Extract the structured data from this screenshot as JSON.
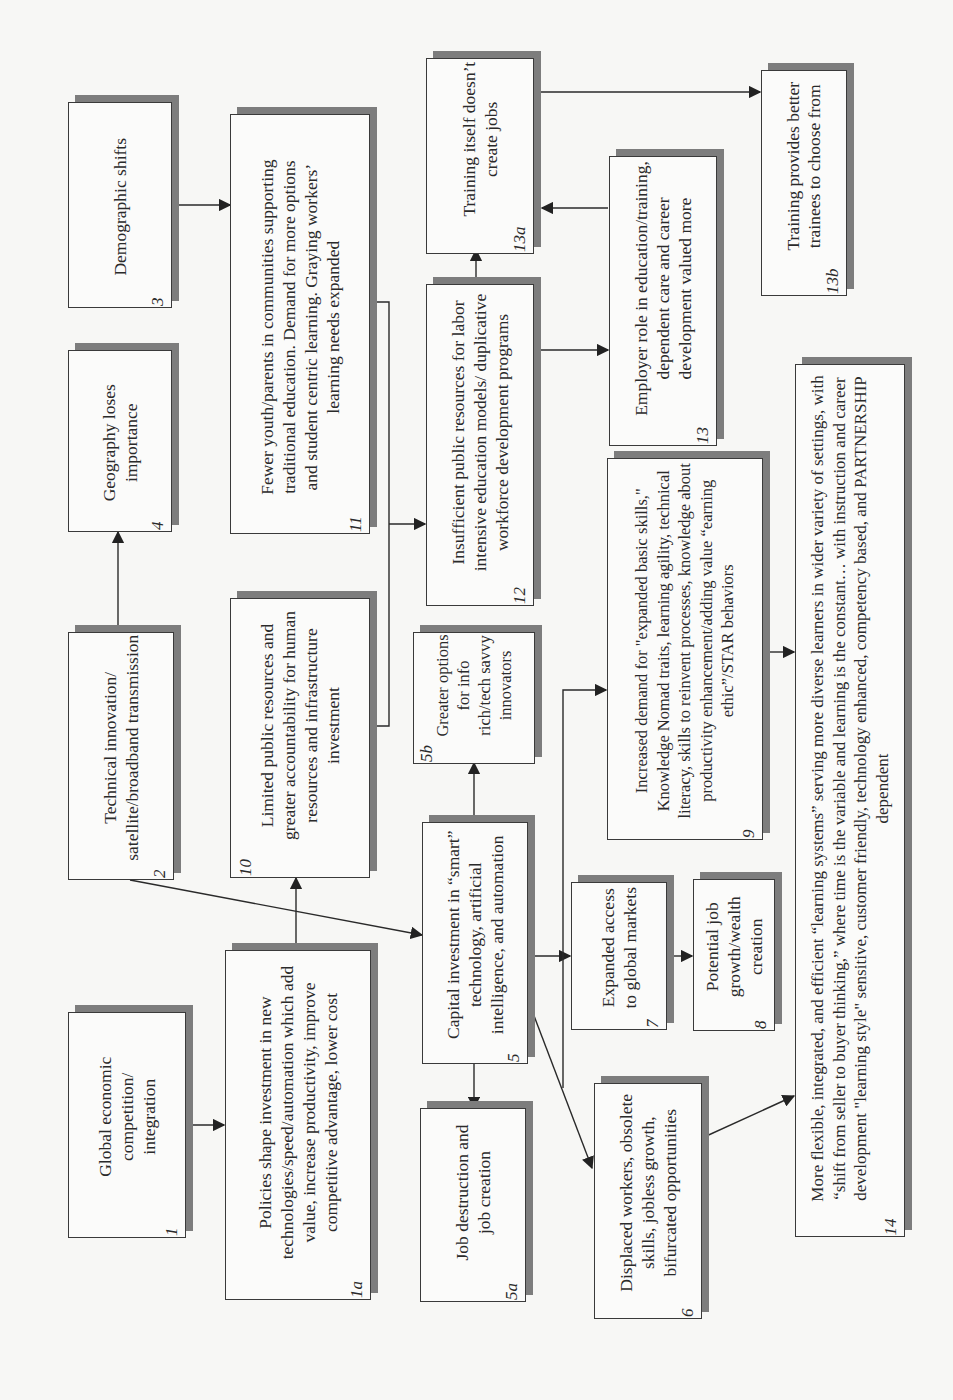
{
  "diagram": {
    "orientation": "rotated 90 degrees counter-clockwise",
    "colors": {
      "border": "#3a3a3a",
      "shadow": "#7d7d7d",
      "box_fill": "#fbfbfa",
      "background": "#f7f7f5"
    },
    "nodes": {
      "n1": {
        "id": "1",
        "text": "Global economic competition/ integration"
      },
      "n1a": {
        "id": "1a",
        "text": "Policies shape investment in new technologies/speed/automation which add value, increase productivity, improve competitive advantage, lower cost"
      },
      "n2": {
        "id": "2",
        "text": "Technical innovation/ satellite/broadband transmission"
      },
      "n3": {
        "id": "3",
        "text": "Demographic shifts"
      },
      "n4": {
        "id": "4",
        "text": "Geography loses importance"
      },
      "n5": {
        "id": "5",
        "text": "Capital investment in “smart” technology, artificial intelligence, and automation"
      },
      "n5a": {
        "id": "5a",
        "text": "Job destruction and job creation"
      },
      "n5b": {
        "id": "5b",
        "text": "Greater options for info rich/tech savvy innovators"
      },
      "n6": {
        "id": "6",
        "text": "Displaced workers, obsolete skills, jobless growth, bifurcated opportunities"
      },
      "n7": {
        "id": "7",
        "text": "Expanded access to global markets"
      },
      "n8": {
        "id": "8",
        "text": "Potential job growth/wealth creation"
      },
      "n9": {
        "id": "9",
        "text": "Increased demand for \"expanded basic skills,\" Knowledge Nomad traits, learning agility, technical literacy, skills to reinvent processes, knowledge about productivity enhancement/adding value “earning ethic”/STAR behaviors"
      },
      "n10": {
        "id": "10",
        "text": "Limited public resources and greater accountability for human resources and infrastructure investment"
      },
      "n11": {
        "id": "11",
        "text": "Fewer youth/parents in communities supporting traditional education. Demand for more options and student centric learning. Graying workers’ learning needs expanded"
      },
      "n12": {
        "id": "12",
        "text": "Insufficient public resources for labor intensive education models/ duplicative workforce development programs"
      },
      "n13": {
        "id": "13",
        "text": "Employer role in education/training, dependent care and career development valued more"
      },
      "n13a": {
        "id": "13a",
        "text": "Training itself doesn’t create jobs"
      },
      "n13b": {
        "id": "13b",
        "text": "Training provides better trainees to choose from"
      },
      "n14": {
        "id": "14",
        "text": "More flexible, integrated, and efficient “learning systems” serving more diverse learners in wider variety of settings, with “shift from seller to buyer thinking,” where time is the variable and learning is the constant… with instruction and career development \"learning style\" sensitive, customer friendly, technology enhanced, competency based, and PARTNERSHIP dependent"
      }
    },
    "edges": [
      [
        "1",
        "1a"
      ],
      [
        "1a",
        "10"
      ],
      [
        "1a",
        "5"
      ],
      [
        "2",
        "4"
      ],
      [
        "2",
        "5"
      ],
      [
        "3",
        "11"
      ],
      [
        "10",
        "12"
      ],
      [
        "11",
        "12"
      ],
      [
        "12",
        "13a"
      ],
      [
        "12",
        "13"
      ],
      [
        "13",
        "13a"
      ],
      [
        "13a",
        "13b"
      ],
      [
        "5",
        "5a"
      ],
      [
        "5",
        "5b"
      ],
      [
        "5",
        "6"
      ],
      [
        "5",
        "7"
      ],
      [
        "5",
        "9"
      ],
      [
        "7",
        "8"
      ],
      [
        "9",
        "14"
      ],
      [
        "6",
        "14"
      ]
    ]
  }
}
